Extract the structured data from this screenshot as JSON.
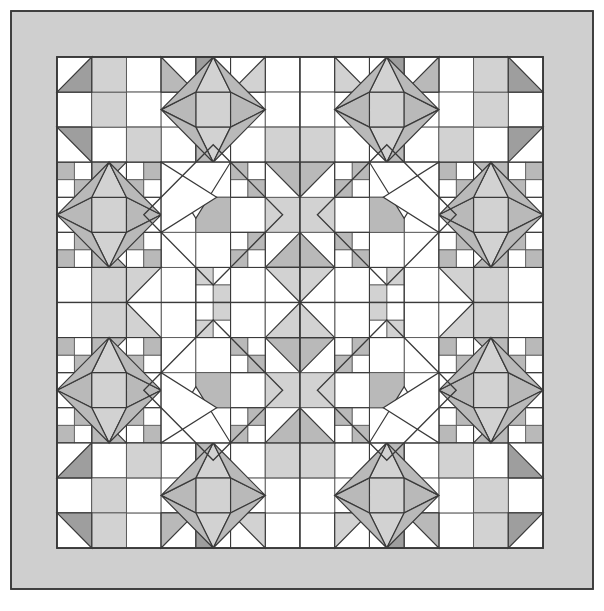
{
  "document": {
    "title": "Quilt Block Layout Diagram",
    "type": "quilt-pattern-diagram",
    "canvas": {
      "width": 604,
      "height": 611,
      "background": "#ffffff"
    }
  },
  "palette": {
    "background": "#ffffff",
    "white": "#ffffff",
    "light_gray": "#d2d2d2",
    "medium_gray": "#b9b9b9",
    "dark_gray": "#9e9e9e",
    "border_fill": "#cfcfcf",
    "outline": "#3a3a3a",
    "grid_line": "#555555"
  },
  "layout": {
    "outer_frame": {
      "x": 11,
      "y": 11,
      "width": 582,
      "height": 578
    },
    "border_width_top": 46,
    "border_width_left": 46,
    "border_width_right": 46,
    "border_width_bottom": 41,
    "field": {
      "x": 57,
      "y": 57,
      "width": 486,
      "height": 491
    },
    "blocks_across": 2,
    "blocks_down": 2,
    "cells_per_block": 7,
    "total_columns": 14,
    "total_rows": 14,
    "cell_width": 34.71,
    "cell_height": 35.07
  },
  "legend": {
    "border_label": "Outer border",
    "block_label": "Star block",
    "fourpatch_label": "Four-patch unit",
    "hst_label": "Half-square triangle"
  },
  "chart_data": {
    "type": "table",
    "note": "7x7 cell star block, mirrored into a 2x2 block layout (14x14 cells).",
    "shades": [
      "white",
      "light_gray",
      "medium_gray",
      "dark_gray"
    ],
    "block_cells": [
      [
        "hst-br-dark",
        "light",
        "white",
        "hst-bl-medium",
        "fourpatch-a",
        "hst-br-light",
        "white"
      ],
      [
        "white",
        "light",
        "white",
        "medium-kite-r",
        "star-center-light",
        "medium-kite-l",
        "white"
      ],
      [
        "hst-tr-dark",
        "white",
        "light",
        "white",
        "fourpatch-b",
        "white",
        "light"
      ],
      [
        "fourpatch-b",
        "hst-tl-medium",
        "fourpatch-a",
        "white",
        "white",
        "fourpatch-a",
        "hst-tr-medium"
      ],
      [
        "medium-kite-r",
        "star-center-light",
        "medium-kite-l",
        "white",
        "medium",
        "white",
        "light"
      ],
      [
        "fourpatch-a",
        "hst-bl-medium",
        "fourpatch-b",
        "white",
        "white",
        "fourpatch-b",
        "hst-br-medium"
      ],
      [
        "white",
        "light",
        "hst-tl-light",
        "medium-kite-r",
        "light",
        "medium-kite-l",
        "hst-tr-light"
      ]
    ]
  }
}
